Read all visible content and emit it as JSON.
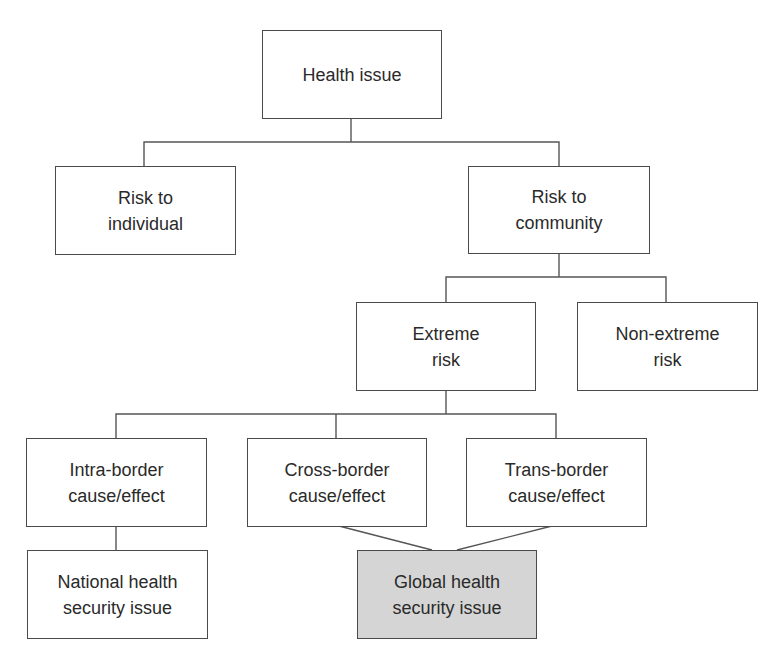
{
  "diagram": {
    "colors": {
      "line": "#555555",
      "box_border": "#4a4a4a",
      "box_fill": "#ffffff",
      "highlight_fill": "#d5d5d5",
      "text": "#2a2a2a"
    },
    "nodes": {
      "health_issue": "Health issue",
      "risk_individual": "Risk to\nindividual",
      "risk_community": "Risk to\ncommunity",
      "extreme_risk": "Extreme\nrisk",
      "non_extreme_risk": "Non-extreme\nrisk",
      "intra_border": "Intra-border\ncause/effect",
      "cross_border": "Cross-border\ncause/effect",
      "trans_border": "Trans-border\ncause/effect",
      "national_security": "National health\nsecurity issue",
      "global_security": "Global health\nsecurity issue"
    },
    "edges": [
      {
        "from": "health_issue",
        "to": "risk_individual"
      },
      {
        "from": "health_issue",
        "to": "risk_community"
      },
      {
        "from": "risk_community",
        "to": "extreme_risk"
      },
      {
        "from": "risk_community",
        "to": "non_extreme_risk"
      },
      {
        "from": "extreme_risk",
        "to": "intra_border"
      },
      {
        "from": "extreme_risk",
        "to": "cross_border"
      },
      {
        "from": "extreme_risk",
        "to": "trans_border"
      },
      {
        "from": "intra_border",
        "to": "national_security"
      },
      {
        "from": "cross_border",
        "to": "global_security"
      },
      {
        "from": "trans_border",
        "to": "global_security"
      }
    ],
    "highlighted_node": "global_security"
  }
}
